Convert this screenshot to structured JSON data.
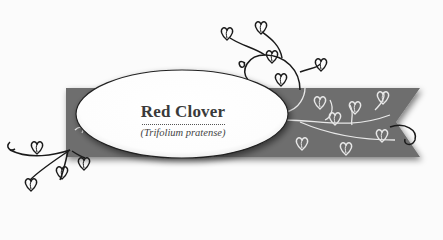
{
  "label": {
    "title": "Red Clover",
    "subtitle": "(Trifolium pratense)"
  },
  "colors": {
    "ribbon": "#6e6e6e",
    "vine_dark": "#1a1a1a",
    "vine_light": "#e8e8e8",
    "oval_fill": "#ffffff",
    "background": "#fbfbfb"
  },
  "decorations": [
    "ribbon-banner",
    "vine-heart-leaves-top",
    "vine-heart-leaves-left",
    "vine-heart-leaves-on-ribbon",
    "oval-label"
  ]
}
